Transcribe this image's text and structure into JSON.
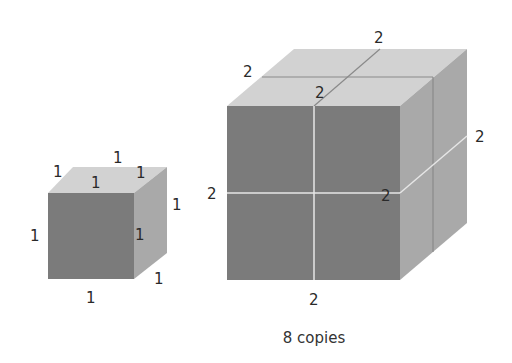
{
  "figure": {
    "small_cube": {
      "edge_length": "1",
      "labels": [
        {
          "id": "top-back",
          "text": "1",
          "x": 117,
          "y": 163
        },
        {
          "id": "top-left",
          "text": "1",
          "x": 57,
          "y": 177
        },
        {
          "id": "top-right",
          "text": "1",
          "x": 140,
          "y": 178
        },
        {
          "id": "top-front",
          "text": "1",
          "x": 95,
          "y": 188
        },
        {
          "id": "right-back",
          "text": "1",
          "x": 176,
          "y": 210
        },
        {
          "id": "front-left",
          "text": "1",
          "x": 34,
          "y": 241
        },
        {
          "id": "front-right",
          "text": "1",
          "x": 139,
          "y": 240
        },
        {
          "id": "right-bottom",
          "text": "1",
          "x": 158,
          "y": 284
        },
        {
          "id": "front-bottom",
          "text": "1",
          "x": 90,
          "y": 303
        }
      ]
    },
    "large_cube": {
      "edge_length": "2",
      "labels": [
        {
          "id": "top-back",
          "text": "2",
          "x": 379,
          "y": 43
        },
        {
          "id": "top-left",
          "text": "2",
          "x": 248,
          "y": 77
        },
        {
          "id": "top-front",
          "text": "2",
          "x": 320,
          "y": 98
        },
        {
          "id": "right-back",
          "text": "2",
          "x": 480,
          "y": 142
        },
        {
          "id": "front-left",
          "text": "2",
          "x": 212,
          "y": 199
        },
        {
          "id": "front-right",
          "text": "2",
          "x": 386,
          "y": 200
        },
        {
          "id": "front-bottom",
          "text": "2",
          "x": 314,
          "y": 305
        }
      ]
    },
    "caption": "8 copies",
    "colors": {
      "top_face": "#d2d2d2",
      "front_face": "#7b7b7b",
      "right_face": "#a9a9a9",
      "seam": "#e6e6e6",
      "top_seam": "#8a8a8a"
    }
  }
}
